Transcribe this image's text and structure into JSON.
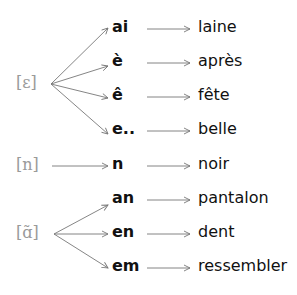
{
  "groups": [
    {
      "phoneme": "[ɛ]",
      "rows": [
        {
          "grapheme": "ai",
          "word": "laine"
        },
        {
          "grapheme": "è",
          "word": "après"
        },
        {
          "grapheme": "ê",
          "word": "fête"
        },
        {
          "grapheme": "e..",
          "word": "belle"
        }
      ]
    },
    {
      "phoneme": "[n]",
      "rows": [
        {
          "grapheme": "n",
          "word": "noir"
        }
      ]
    },
    {
      "phoneme": "[ɑ̃]",
      "rows": [
        {
          "grapheme": "an",
          "word": "pantalon"
        },
        {
          "grapheme": "en",
          "word": "dent"
        },
        {
          "grapheme": "em",
          "word": "ressembler"
        }
      ]
    }
  ],
  "colors": {
    "phoneme": "#9a9a9a",
    "arrow": "#777777",
    "text": "#111111"
  }
}
